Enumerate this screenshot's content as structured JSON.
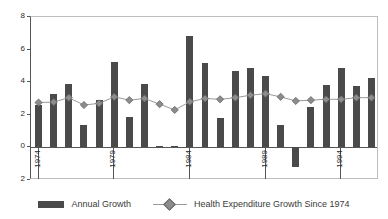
{
  "chart_data": {
    "type": "bar",
    "title": "",
    "subtitle": "",
    "xlabel": "",
    "ylabel": "",
    "ylim": [
      -2,
      8
    ],
    "ytick_labels": [
      "8",
      "6",
      "4",
      "2",
      "0",
      "2"
    ],
    "ytick_values": [
      8,
      6,
      4,
      2,
      0,
      -2
    ],
    "grid": false,
    "legend_position": "bottom",
    "categories": [
      "1974",
      "1975",
      "1976",
      "1977",
      "1978",
      "1979",
      "1980",
      "1981",
      "1982",
      "1983",
      "1984",
      "1985",
      "1986",
      "1987",
      "1988",
      "1989",
      "1990",
      "1991",
      "1992",
      "1993",
      "1994",
      "1995",
      "1996"
    ],
    "xtick_labels_shown": [
      "1974",
      "1979",
      "1984",
      "1989",
      "1994"
    ],
    "series": [
      {
        "name": "Annual Growth",
        "type": "bar",
        "color": "#4a4a4a",
        "values": [
          2.6,
          3.3,
          3.9,
          1.35,
          2.9,
          5.25,
          1.85,
          3.9,
          0.1,
          0.1,
          6.85,
          5.2,
          1.8,
          4.7,
          4.85,
          4.4,
          1.4,
          -1.2,
          2.5,
          3.8,
          4.9,
          3.75,
          4.25
        ]
      },
      {
        "name": "Health Expenditure Growth Since 1974",
        "type": "line",
        "color": "#8c8c8c",
        "line_color": "#9a9a9a",
        "marker": "diamond",
        "values": [
          2.75,
          2.78,
          3.05,
          2.6,
          2.7,
          3.1,
          2.9,
          3.0,
          2.65,
          2.3,
          2.8,
          3.0,
          2.95,
          3.05,
          3.2,
          3.3,
          3.1,
          2.85,
          2.9,
          2.95,
          2.95,
          3.05,
          3.05
        ]
      }
    ]
  },
  "legend": {
    "items": [
      {
        "label": "Annual Growth",
        "marker": "bar-swatch"
      },
      {
        "label": "Health Expenditure Growth Since 1974",
        "marker": "line-diamond-swatch"
      }
    ]
  },
  "colors": {
    "bar": "#4a4a4a",
    "line": "#9a9a9a",
    "marker_fill": "#8c8c8c",
    "marker_edge": "#666666",
    "axis": "#555555",
    "frame": "#bdbdbd",
    "text": "#2b2b2b",
    "background": "#ffffff"
  }
}
